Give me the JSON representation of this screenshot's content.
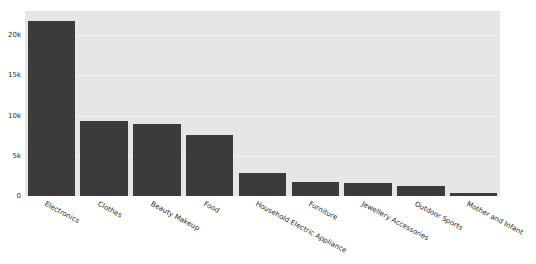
{
  "chart_data": {
    "type": "bar",
    "title": "",
    "subtitle": "",
    "xlabel": "",
    "ylabel": "",
    "grid": true,
    "legend": false,
    "ylim": [
      0,
      23000
    ],
    "ytick_values": [
      0,
      5000,
      10000,
      15000,
      20000
    ],
    "ytick_labels": [
      "0",
      "5k",
      "10k",
      "15k",
      "20k"
    ],
    "categories": [
      "Electronics",
      "Clothes",
      "Beauty Makeup",
      "Food",
      "Household Electric Appliance",
      "Furniture",
      "Jewellery Accessories",
      "Outdoor Sports",
      "Mother and Infant"
    ],
    "values": [
      21800,
      9300,
      9000,
      7600,
      2900,
      1800,
      1600,
      1200,
      350
    ],
    "bar_color": "#3b3b3b",
    "plot_background": "#e6e6e6",
    "gridline_color": "#f4f4f4",
    "figure_background": "#ffffff"
  }
}
